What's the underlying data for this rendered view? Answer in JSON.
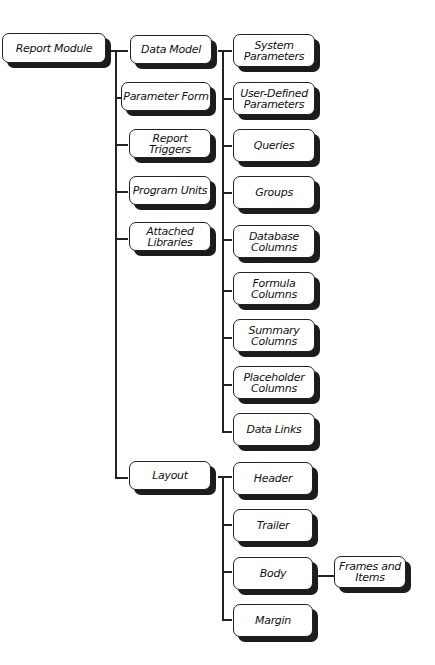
{
  "diagram": {
    "root": {
      "label": "Report Module"
    },
    "level1": [
      {
        "label": "Data Model"
      },
      {
        "label": "Parameter Form"
      },
      {
        "label": "Report Triggers"
      },
      {
        "label": "Program Units"
      },
      {
        "label": "Attached Libraries"
      },
      {
        "label": "Layout"
      }
    ],
    "data_model_children": [
      {
        "label": "System Parameters"
      },
      {
        "label": "User-Defined Parameters"
      },
      {
        "label": "Queries"
      },
      {
        "label": "Groups"
      },
      {
        "label": "Database Columns"
      },
      {
        "label": "Formula Columns"
      },
      {
        "label": "Summary Columns"
      },
      {
        "label": "Placeholder Columns"
      },
      {
        "label": "Data Links"
      }
    ],
    "layout_children": [
      {
        "label": "Header"
      },
      {
        "label": "Trailer"
      },
      {
        "label": "Body"
      },
      {
        "label": "Margin"
      }
    ],
    "body_children": [
      {
        "label": "Frames and Items"
      }
    ]
  }
}
